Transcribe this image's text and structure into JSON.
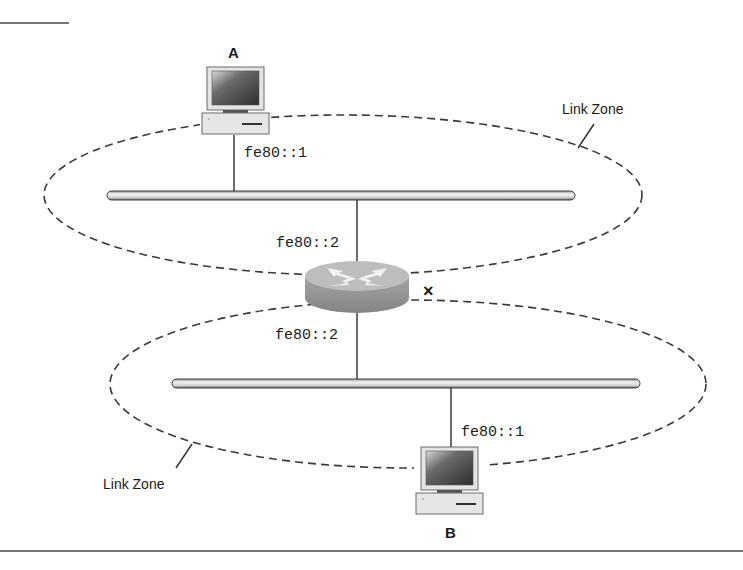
{
  "diagram": {
    "type": "network-topology",
    "hosts": [
      {
        "id": "A",
        "label": "A",
        "address": "fe80::1",
        "zone": "top"
      },
      {
        "id": "B",
        "label": "B",
        "address": "fe80::1",
        "zone": "bottom"
      }
    ],
    "router": {
      "top_interface": "fe80::2",
      "bottom_interface": "fe80::2",
      "blocked_marker": "×"
    },
    "zones": [
      {
        "id": "top",
        "label": "Link Zone"
      },
      {
        "id": "bottom",
        "label": "Link Zone"
      }
    ],
    "colors": {
      "line": "#2b2b2b",
      "dash": "#3a3a3a",
      "router_top": "#b9b9b9",
      "router_side": "#8f8f8f",
      "bar_fill": "#e6e6e6"
    }
  }
}
